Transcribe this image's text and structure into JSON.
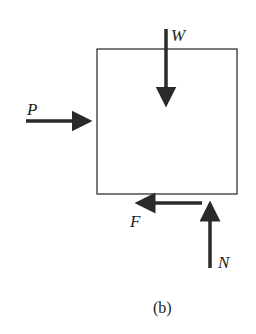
{
  "diagram": {
    "type": "free-body-diagram",
    "caption": "(b)",
    "body": {
      "shape": "rectangle"
    },
    "forces": [
      {
        "label": "W",
        "direction": "down"
      },
      {
        "label": "P",
        "direction": "right"
      },
      {
        "label": "F",
        "direction": "left"
      },
      {
        "label": "N",
        "direction": "up"
      }
    ],
    "colors": {
      "stroke": "#333333",
      "arrow": "#2a2a2a",
      "background": "#ffffff"
    }
  }
}
